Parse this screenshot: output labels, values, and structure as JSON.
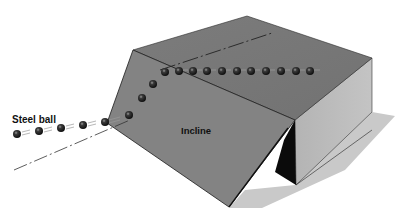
{
  "diagram": {
    "labels": {
      "steel_ball": "Steel ball",
      "incline": "Incline"
    },
    "colors": {
      "background": "#ffffff",
      "top_face": "#7a7a7a",
      "incline_face": "#828282",
      "side_face": "#bdbdbd",
      "shadow": "#c8c8c8",
      "dark_gap": "#0a0a0a",
      "ball": "#1a1a1a"
    },
    "balls": {
      "approach": [
        [
          18,
          134
        ],
        [
          40,
          131
        ],
        [
          62,
          128
        ],
        [
          84,
          125
        ],
        [
          105,
          122
        ],
        [
          129,
          115
        ]
      ],
      "incline": [
        [
          142,
          98
        ],
        [
          153,
          84
        ],
        [
          165,
          72
        ]
      ],
      "top": [
        [
          179,
          71
        ],
        [
          193,
          71
        ],
        [
          207,
          71
        ],
        [
          222,
          71
        ],
        [
          237,
          71
        ],
        [
          251,
          71
        ],
        [
          266,
          71
        ],
        [
          281,
          71
        ],
        [
          296,
          71
        ],
        [
          310,
          71
        ]
      ]
    }
  }
}
